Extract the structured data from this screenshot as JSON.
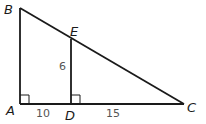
{
  "diagram": {
    "type": "geometry-triangle",
    "colors": {
      "line": "#1a1a1a",
      "label": "#1a1a1a",
      "measure": "#555555",
      "background": "#ffffff"
    },
    "points": {
      "A": {
        "label": "A",
        "x": 20,
        "y": 104
      },
      "B": {
        "label": "B",
        "x": 20,
        "y": 8
      },
      "C": {
        "label": "C",
        "x": 184,
        "y": 104
      },
      "D": {
        "label": "D",
        "x": 71,
        "y": 104
      },
      "E": {
        "label": "E",
        "x": 71,
        "y": 39
      }
    },
    "segments": [
      {
        "from": "A",
        "to": "B"
      },
      {
        "from": "B",
        "to": "C"
      },
      {
        "from": "A",
        "to": "C"
      },
      {
        "from": "D",
        "to": "E"
      }
    ],
    "right_angles": [
      "A",
      "D"
    ],
    "measurements": {
      "DE": "6",
      "AD": "10",
      "DC": "15"
    }
  }
}
